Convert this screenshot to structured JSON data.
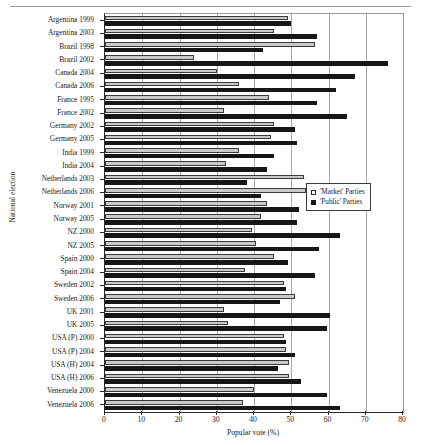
{
  "chart_data": {
    "type": "bar",
    "orientation": "horizontal",
    "title": "",
    "xlabel": "Popular vote (%)",
    "ylabel": "National election",
    "xlim": [
      0,
      80
    ],
    "xticks": [
      0,
      10,
      20,
      30,
      40,
      50,
      60,
      70,
      80
    ],
    "grid": true,
    "grid_axis": "x",
    "legend_position": "center-right",
    "categories": [
      "Argentina 1999",
      "Argentina 2003",
      "Brazil 1998",
      "Brazil 2002",
      "Canada 2004",
      "Canada 2006",
      "France 1995",
      "France 2002",
      "Germany 2002",
      "Germany 2005",
      "India 1999",
      "India 2004",
      "Netherlands 2003",
      "Netherlands 2006",
      "Norway 2001",
      "Norway 2005",
      "NZ 2000",
      "NZ 2005",
      "Spain 2000",
      "Spain 2004",
      "Sweden 2002",
      "Sweden 2006",
      "UK 2001",
      "UK 2005",
      "USA (P) 2000",
      "USA (P) 2004",
      "USA (H) 2004",
      "USA (H) 2006",
      "Venezuela 2000",
      "Venezuela 2006"
    ],
    "series": [
      {
        "name": "'Market' Parties",
        "color": "#c9c9c9",
        "values": [
          49.0,
          45.5,
          56.5,
          24.0,
          30.0,
          36.0,
          44.0,
          32.0,
          45.5,
          44.5,
          36.0,
          32.5,
          53.5,
          54.0,
          43.5,
          42.0,
          39.5,
          40.5,
          45.5,
          37.5,
          48.0,
          51.0,
          32.0,
          33.0,
          48.0,
          48.5,
          49.5,
          49.5,
          40.0,
          37.0
        ]
      },
      {
        "name": "'Public' Parties",
        "color": "#161616",
        "values": [
          50.0,
          57.0,
          42.5,
          76.0,
          67.0,
          62.0,
          57.0,
          65.0,
          51.0,
          51.5,
          45.5,
          43.5,
          38.0,
          42.0,
          52.0,
          51.5,
          63.0,
          57.5,
          49.0,
          56.5,
          48.5,
          47.0,
          60.5,
          59.5,
          48.5,
          51.0,
          46.5,
          52.5,
          59.5,
          63.0
        ]
      }
    ]
  },
  "axes": {
    "x_title": "Popular vote (%)",
    "y_title": "National election",
    "x_tick_labels": [
      "0",
      "10",
      "20",
      "30",
      "40",
      "50",
      "60",
      "70",
      "80"
    ]
  },
  "legend": {
    "items": [
      {
        "label": "'Market' Parties",
        "swatch": "market-swatch"
      },
      {
        "label": "'Public' Parties",
        "swatch": "public-swatch"
      }
    ]
  }
}
